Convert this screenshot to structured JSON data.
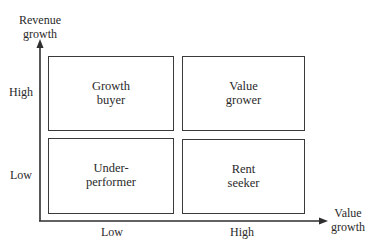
{
  "diagram": {
    "type": "2x2 matrix",
    "y_axis": {
      "title_line1": "Revenue",
      "title_line2": "growth",
      "ticks": [
        "High",
        "Low"
      ]
    },
    "x_axis": {
      "title_line1": "Value",
      "title_line2": "growth",
      "ticks": [
        "Low",
        "High"
      ]
    },
    "quadrants": [
      {
        "position": "top-left",
        "line1": "Growth",
        "line2": "buyer"
      },
      {
        "position": "top-right",
        "line1": "Value",
        "line2": "grower"
      },
      {
        "position": "bottom-left",
        "line1": "Under-",
        "line2": "performer"
      },
      {
        "position": "bottom-right",
        "line1": "Rent",
        "line2": "seeker"
      }
    ],
    "colors": {
      "line": "#3a3a3a",
      "text": "#2a2a2a",
      "background": "#ffffff"
    }
  }
}
